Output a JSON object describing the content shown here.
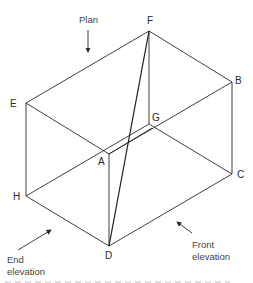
{
  "diagram": {
    "type": "isometric-box-projection",
    "vertices": {
      "A": {
        "label": "A",
        "x": 109,
        "y": 154
      },
      "B": {
        "label": "B",
        "x": 232,
        "y": 82
      },
      "C": {
        "label": "C",
        "x": 232,
        "y": 174
      },
      "D": {
        "label": "D",
        "x": 109,
        "y": 246
      },
      "E": {
        "label": "E",
        "x": 26,
        "y": 103
      },
      "F": {
        "label": "F",
        "x": 149,
        "y": 31
      },
      "G": {
        "label": "G",
        "x": 149,
        "y": 124
      },
      "H": {
        "label": "H",
        "x": 26,
        "y": 196
      }
    },
    "edges": [
      "E-F",
      "F-B",
      "B-A",
      "A-E",
      "E-H",
      "A-D",
      "B-C",
      "H-D",
      "D-C",
      "F-G",
      "G-H",
      "G-C",
      "A-G"
    ],
    "diagonal": "F-D",
    "view_labels": {
      "plan": "Plan",
      "front_line1": "Front",
      "front_line2": "elevation",
      "end_line1": "End",
      "end_line2": "elevation"
    },
    "caption_partial": "..."
  },
  "colors": {
    "line": "#2a2a2a",
    "text": "#2a2a2a",
    "background": "#ffffff"
  }
}
